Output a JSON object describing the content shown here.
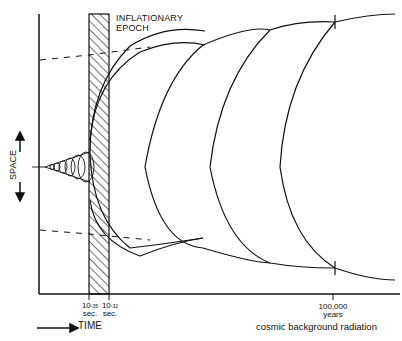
{
  "diagram": {
    "title_line1": "INFLATIONARY",
    "title_line2": "EPOCH",
    "y_axis_label": "SPACE",
    "x_axis_label": "TIME",
    "ticks": [
      {
        "base": "10",
        "exp": "-35",
        "unit": "sec."
      },
      {
        "base": "10",
        "exp": "-32",
        "unit": "sec."
      },
      {
        "value": "100,000",
        "unit": "years"
      }
    ],
    "bottom_caption": "cosmic background radiation",
    "colors": {
      "line": "#111111",
      "background": "#ffffff"
    }
  }
}
